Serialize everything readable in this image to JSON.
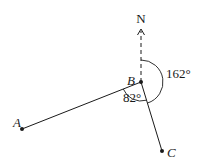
{
  "diagram": {
    "type": "bearing-diagram",
    "points": {
      "A": {
        "label": "A",
        "x": 22,
        "y": 129
      },
      "B": {
        "label": "B",
        "x": 141,
        "y": 82
      },
      "C": {
        "label": "C",
        "x": 162,
        "y": 151
      }
    },
    "north": {
      "label": "N",
      "tip_x": 141,
      "tip_y": 30
    },
    "angles": {
      "bearing_BC": {
        "label": "162°",
        "value": 162
      },
      "angle_ABC": {
        "label": "82°",
        "value": 82
      }
    },
    "colors": {
      "stroke": "#1a1a1a",
      "background": "#ffffff"
    }
  }
}
